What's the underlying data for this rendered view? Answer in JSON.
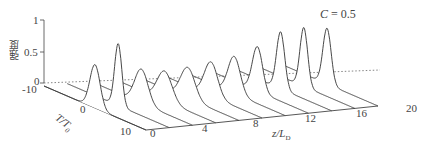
{
  "chart_data": {
    "type": "line",
    "subtype": "3d-waterfall",
    "title": "",
    "annotation": "C = 0.5",
    "xlabel": "T/T₀",
    "ylabel": "z/L_D",
    "zlabel": "强度",
    "x_ticks": [
      "-10",
      "0",
      "10"
    ],
    "y_ticks": [
      "0",
      "4",
      "8",
      "12",
      "16",
      "20"
    ],
    "z_ticks": [
      "0",
      "0.5",
      "1"
    ],
    "xlim": [
      -10,
      10
    ],
    "ylim": [
      0,
      20
    ],
    "zlim": [
      0,
      1
    ],
    "grid": false,
    "legend": null,
    "series": [
      {
        "name": "z/L_D = 0",
        "z": 0,
        "peak": 0.7,
        "width": 1.0
      },
      {
        "name": "z/L_D = 2",
        "z": 2,
        "peak": 1.0,
        "width": 0.7
      },
      {
        "name": "z/L_D = 4",
        "z": 4,
        "peak": 0.55,
        "width": 1.3
      },
      {
        "name": "z/L_D = 6",
        "z": 6,
        "peak": 0.48,
        "width": 1.45
      },
      {
        "name": "z/L_D = 8",
        "z": 8,
        "peak": 0.5,
        "width": 1.4
      },
      {
        "name": "z/L_D = 10",
        "z": 10,
        "peak": 0.55,
        "width": 1.3
      },
      {
        "name": "z/L_D = 12",
        "z": 12,
        "peak": 0.6,
        "width": 1.2
      },
      {
        "name": "z/L_D = 14",
        "z": 14,
        "peak": 0.72,
        "width": 1.0
      },
      {
        "name": "z/L_D = 16",
        "z": 16,
        "peak": 0.92,
        "width": 0.8
      },
      {
        "name": "z/L_D = 18",
        "z": 18,
        "peak": 0.95,
        "width": 0.75
      },
      {
        "name": "z/L_D = 20",
        "z": 20,
        "peak": 0.9,
        "width": 0.8
      }
    ]
  },
  "labels": {
    "annotation": "C = 0.5",
    "zlabel": "强度",
    "xlabel_main": "T/T",
    "xlabel_sub": "0",
    "ylabel_main": "z/L",
    "ylabel_sub": "D",
    "z_tick_0": "0",
    "z_tick_05": "0.5",
    "z_tick_1": "1",
    "x_tick_m10": "-10",
    "x_tick_0": "0",
    "x_tick_10": "10",
    "y_tick_0": "0",
    "y_tick_4": "4",
    "y_tick_8": "8",
    "y_tick_12": "12",
    "y_tick_16": "16",
    "y_tick_20": "20"
  }
}
